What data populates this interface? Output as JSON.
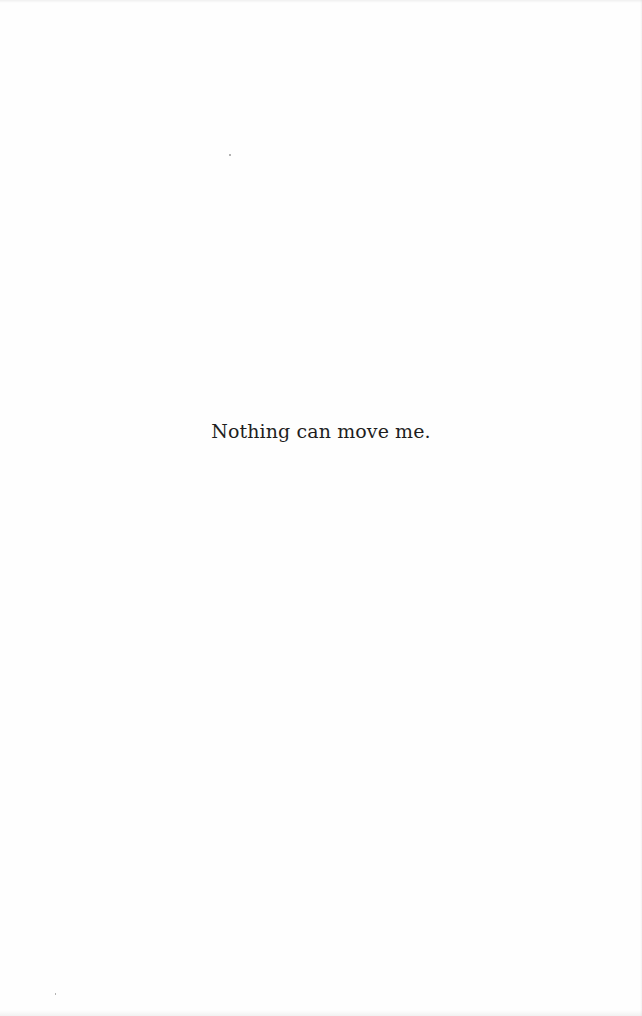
{
  "page": {
    "text": "Nothing can move me."
  }
}
